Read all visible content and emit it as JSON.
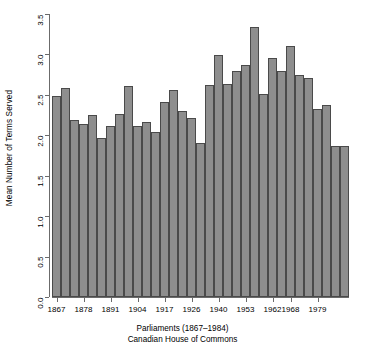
{
  "chart_data": {
    "type": "bar",
    "title": "",
    "subtitle": "",
    "xlabel": "Parliaments (1867–1984)",
    "xlabel_line2": "Canadian House of Commons",
    "ylabel": "Mean Number of Terms Served",
    "ylim": [
      0.0,
      3.5
    ],
    "ytick_labels": [
      "0.0",
      "0.5",
      "1.0",
      "1.5",
      "2.0",
      "2.5",
      "3.0",
      "3.5"
    ],
    "ytick_values": [
      0.0,
      0.5,
      1.0,
      1.5,
      2.0,
      2.5,
      3.0,
      3.5
    ],
    "xtick_labels": [
      "1867",
      "1878",
      "1891",
      "1904",
      "1917",
      "1926",
      "1940",
      "1953",
      "1962",
      "1968",
      "1979"
    ],
    "xtick_bar_index": [
      0,
      3,
      6,
      9,
      12,
      15,
      18,
      21,
      24,
      26,
      29
    ],
    "grid": false,
    "legend": false,
    "bar_color": "#8e8e8e",
    "bar_border_color": "#4a4a4a",
    "axis_color": "#6b6b6b",
    "n_bars": 33,
    "categories": [
      "1",
      "2",
      "3",
      "4",
      "5",
      "6",
      "7",
      "8",
      "9",
      "10",
      "11",
      "12",
      "13",
      "14",
      "15",
      "16",
      "17",
      "18",
      "19",
      "20",
      "21",
      "22",
      "23",
      "24",
      "25",
      "26",
      "27",
      "28",
      "29",
      "30",
      "31",
      "32",
      "33"
    ],
    "values": [
      2.48,
      2.59,
      2.19,
      2.14,
      2.25,
      1.97,
      2.11,
      2.26,
      2.61,
      2.12,
      2.17,
      2.04,
      2.41,
      2.56,
      2.3,
      2.21,
      1.9,
      2.62,
      2.99,
      2.64,
      2.79,
      2.87,
      3.34,
      2.51,
      2.96,
      2.79,
      3.11,
      2.75,
      2.71,
      2.33,
      2.37,
      1.87,
      1.87
    ]
  }
}
